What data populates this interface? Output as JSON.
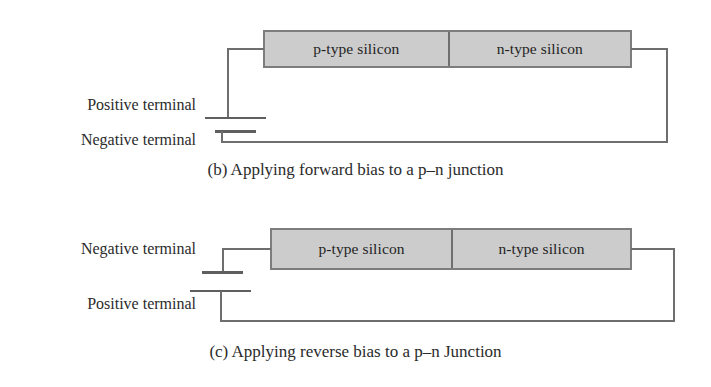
{
  "figure": {
    "panels": [
      {
        "id": "b",
        "caption": "(b) Applying forward bias to a p–n junction",
        "device": {
          "p_side_label": "p-type silicon",
          "n_side_label": "n-type silicon"
        },
        "battery": {
          "upper_terminal_label": "Positive terminal",
          "lower_terminal_label": "Negative terminal",
          "upper_plate": "long",
          "lower_plate": "short"
        }
      },
      {
        "id": "c",
        "caption": "(c) Applying reverse bias to a p–n Junction",
        "device": {
          "p_side_label": "p-type silicon",
          "n_side_label": "n-type silicon"
        },
        "battery": {
          "upper_terminal_label": "Negative terminal",
          "lower_terminal_label": "Positive terminal",
          "upper_plate": "short",
          "lower_plate": "long"
        }
      }
    ],
    "colors": {
      "silicon_fill": "#cccccc",
      "silicon_border": "#7d7d7d",
      "wire": "#6e6e6e",
      "text": "#2b2b2b",
      "background": "#ffffff"
    }
  }
}
